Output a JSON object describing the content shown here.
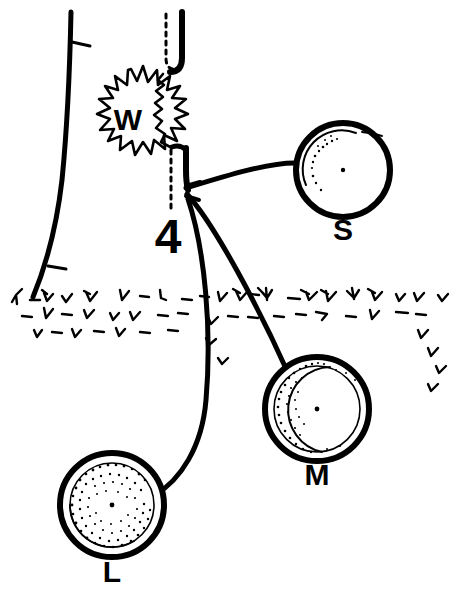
{
  "figure": {
    "background_color": "#ffffff",
    "ink_color": "#000000",
    "width": 465,
    "height": 599,
    "labels": {
      "wound": "W",
      "step_number": "4",
      "small_circle": "S",
      "medium_circle": "M",
      "large_circle": "L"
    },
    "bottom_caption": "",
    "elements": {
      "trunk": "tree-trunk",
      "broken_branch_stub": "broken-branch-stub",
      "branch_dotted_outline": "removed-branch-dotted-outline",
      "wound_starburst": "wound-starburst",
      "ground_line": "ground-grass-line",
      "leader_lines": 3
    },
    "circles": [
      {
        "id": "S",
        "label": "S",
        "cx": 343,
        "cy": 170,
        "r": 47,
        "inner_r": 39,
        "stipple_density": "sparse",
        "description": "small decay column cross-section"
      },
      {
        "id": "M",
        "label": "M",
        "cx": 317,
        "cy": 409,
        "r": 52,
        "inner_r": 43,
        "stipple_density": "medium",
        "description": "medium decay column cross-section"
      },
      {
        "id": "L",
        "label": "L",
        "cx": 112,
        "cy": 505,
        "r": 52,
        "inner_r": 43,
        "stipple_density": "dense",
        "description": "large decay column cross-section"
      }
    ]
  }
}
